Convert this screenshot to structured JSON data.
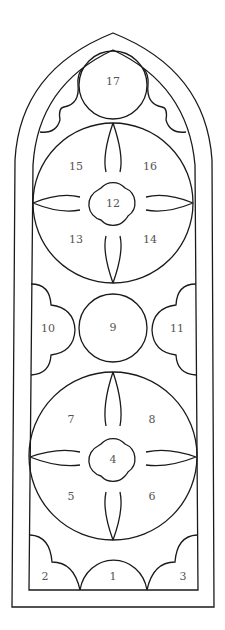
{
  "diagram": {
    "title": "",
    "stroke_color": "#1a1a1a",
    "label_color": "#555555",
    "regions": [
      {
        "id": "1",
        "label": "1",
        "x": 113,
        "y": 577
      },
      {
        "id": "2",
        "label": "2",
        "x": 45,
        "y": 577
      },
      {
        "id": "3",
        "label": "3",
        "x": 183,
        "y": 577
      },
      {
        "id": "4",
        "label": "4",
        "x": 113,
        "y": 460
      },
      {
        "id": "5",
        "label": "5",
        "x": 71,
        "y": 497
      },
      {
        "id": "6",
        "label": "6",
        "x": 152,
        "y": 497
      },
      {
        "id": "7",
        "label": "7",
        "x": 71,
        "y": 420
      },
      {
        "id": "8",
        "label": "8",
        "x": 152,
        "y": 420
      },
      {
        "id": "9",
        "label": "9",
        "x": 113,
        "y": 328
      },
      {
        "id": "10",
        "label": "10",
        "x": 48,
        "y": 329
      },
      {
        "id": "11",
        "label": "11",
        "x": 177,
        "y": 329
      },
      {
        "id": "12",
        "label": "12",
        "x": 113,
        "y": 204
      },
      {
        "id": "13",
        "label": "13",
        "x": 76,
        "y": 240
      },
      {
        "id": "14",
        "label": "14",
        "x": 150,
        "y": 240
      },
      {
        "id": "15",
        "label": "15",
        "x": 76,
        "y": 167
      },
      {
        "id": "16",
        "label": "16",
        "x": 150,
        "y": 167
      },
      {
        "id": "17",
        "label": "17",
        "x": 113,
        "y": 82
      }
    ]
  }
}
